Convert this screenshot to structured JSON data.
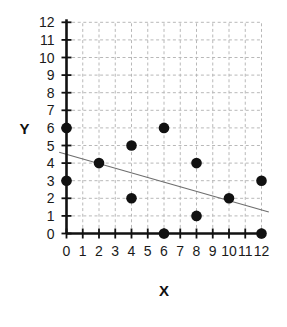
{
  "chart_data": {
    "type": "scatter",
    "title": "",
    "subtitle": "",
    "xlabel": "X",
    "ylabel": "Y",
    "xlim": [
      0,
      12
    ],
    "ylim": [
      0,
      12
    ],
    "xticks": [
      0,
      1,
      2,
      3,
      4,
      5,
      6,
      7,
      8,
      9,
      10,
      11,
      12
    ],
    "yticks": [
      0,
      1,
      2,
      3,
      4,
      5,
      6,
      7,
      8,
      9,
      10,
      11,
      12
    ],
    "xtick_labels": [
      "0",
      "1",
      "2",
      "3",
      "4",
      "5",
      "6",
      "7",
      "8",
      "9",
      "10",
      "11",
      "12"
    ],
    "ytick_labels": [
      "0",
      "1",
      "2",
      "3",
      "4",
      "5",
      "6",
      "7",
      "8",
      "9",
      "10",
      "11",
      "12"
    ],
    "grid": true,
    "grid_style": "dashed",
    "grid_color": "#b8b8b8",
    "legend": false,
    "legend_position": "none",
    "marker": "filled-circle",
    "marker_color": "#111111",
    "marker_size": 6,
    "points": [
      {
        "x": 0,
        "y": 6
      },
      {
        "x": 0,
        "y": 3
      },
      {
        "x": 2,
        "y": 4
      },
      {
        "x": 4,
        "y": 5
      },
      {
        "x": 4,
        "y": 2
      },
      {
        "x": 6,
        "y": 6
      },
      {
        "x": 6,
        "y": 0
      },
      {
        "x": 8,
        "y": 4
      },
      {
        "x": 8,
        "y": 1
      },
      {
        "x": 10,
        "y": 2
      },
      {
        "x": 12,
        "y": 3
      },
      {
        "x": 12,
        "y": 0
      }
    ],
    "trendline": {
      "type": "line",
      "color": "#6e6e6e",
      "x_start": -0.45,
      "y_start": 4.62,
      "x_end": 12.45,
      "y_end": 1.22,
      "slope": -0.264,
      "intercept": 4.5
    },
    "axis_color": "#111111",
    "background": "#ffffff"
  }
}
